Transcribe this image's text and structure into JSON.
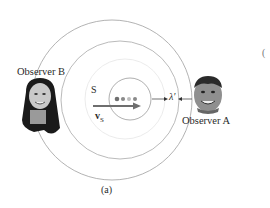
{
  "figure": {
    "caption": "(a)",
    "source_label": "S",
    "velocity_label": "v",
    "velocity_subscript": "S",
    "wavelength_label": "λ′",
    "observers": [
      {
        "id": "B",
        "label": "Observer B",
        "position": "left"
      },
      {
        "id": "A",
        "label": "Observer A",
        "position": "right"
      }
    ],
    "stray_text": "(",
    "wavefronts": [
      {
        "cx": 130,
        "cy": 99,
        "r": 21,
        "color": "#9a9a9a"
      },
      {
        "cx": 125,
        "cy": 99,
        "r": 40,
        "color": "#e6e6e6"
      },
      {
        "cx": 120,
        "cy": 100,
        "r": 59,
        "color": "#a8a8a8"
      },
      {
        "cx": 112,
        "cy": 100,
        "r": 80,
        "color": "#a0a0a0"
      }
    ],
    "source_dots": [
      {
        "cx": 117,
        "cy": 99,
        "color": "#707070"
      },
      {
        "cx": 123,
        "cy": 99,
        "color": "#8a8a8a"
      },
      {
        "cx": 129,
        "cy": 99,
        "color": "#bdbdbd"
      },
      {
        "cx": 135,
        "cy": 99,
        "color": "#8a8a8a"
      }
    ],
    "colors": {
      "velocity_arrow": "#6e6e6e",
      "text": "#2a2a2a"
    }
  }
}
